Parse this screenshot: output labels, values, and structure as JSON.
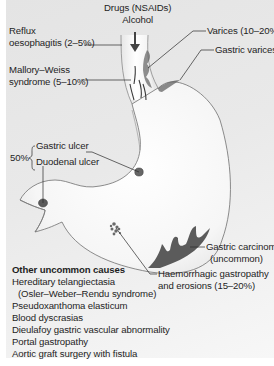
{
  "diagram": {
    "colors": {
      "panel_background": "#e8e8e8",
      "stomach_fill": "#f7f7f7",
      "outline": "#6a6a6a",
      "lesion": "#555555",
      "text": "#1e1e1e"
    },
    "labels": {
      "drugs": {
        "line1": "Drugs (NSAIDs)",
        "line2": "Alcohol"
      },
      "reflux": {
        "line1": "Reflux",
        "line2": "oesophagitis (2–5%)"
      },
      "mallory_weiss": {
        "line1": "Mallory–Weiss",
        "line2": "syndrome (5–10%)"
      },
      "varices": "Varices (10–20%)",
      "gastric_varices": "Gastric varices",
      "ulcer_group": {
        "percent": "50%",
        "gastric_ulcer": "Gastric ulcer",
        "duodenal_ulcer": "Duodenal ulcer"
      },
      "gastric_carcinoma": {
        "line1": "Gastric carcinoma",
        "line2": "(uncommon)"
      },
      "haemorrhagic": {
        "line1": "Haemorrhagic gastropathy",
        "line2": "and erosions (15–20%)"
      }
    },
    "other_uncommon_causes": {
      "title": "Other uncommon causes",
      "items": [
        "Hereditary telangiectasia",
        "(Osler–Weber–Rendu syndrome)",
        "Pseudoxanthoma elasticum",
        "Blood dyscrasias",
        "Dieulafoy gastric vascular abnormality",
        "Portal gastropathy",
        "Aortic graft surgery with fistula"
      ]
    }
  }
}
